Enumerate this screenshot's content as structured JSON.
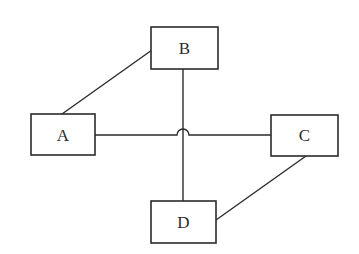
{
  "diagram": {
    "type": "network-graph",
    "nodes": [
      {
        "id": "A",
        "label": "A"
      },
      {
        "id": "B",
        "label": "B"
      },
      {
        "id": "C",
        "label": "C"
      },
      {
        "id": "D",
        "label": "D"
      }
    ],
    "edges": [
      {
        "from": "A",
        "to": "B"
      },
      {
        "from": "A",
        "to": "C"
      },
      {
        "from": "B",
        "to": "D"
      },
      {
        "from": "C",
        "to": "D"
      }
    ],
    "crossing_style": "line-hop"
  }
}
